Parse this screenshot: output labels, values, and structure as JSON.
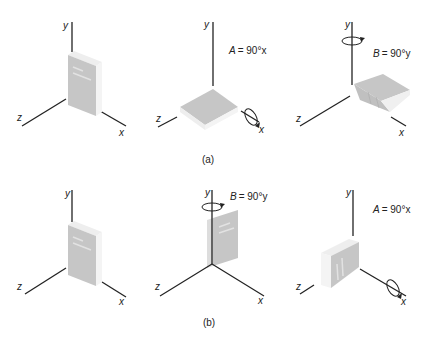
{
  "rows": [
    {
      "caption": "(a)",
      "panels": [
        {
          "state": "initial",
          "axes": {
            "x": "x",
            "y": "y",
            "z": "z"
          }
        },
        {
          "state": "after-rotation-A",
          "equation": {
            "lhs": "A",
            "rhs": "= 90°x"
          },
          "rotation_axis": "x",
          "axes": {
            "x": "x",
            "y": "y",
            "z": "z"
          }
        },
        {
          "state": "after-rotation-B",
          "equation": {
            "lhs": "B",
            "rhs": "= 90°y"
          },
          "rotation_axis": "y",
          "axes": {
            "x": "x",
            "y": "y",
            "z": "z"
          }
        }
      ]
    },
    {
      "caption": "(b)",
      "panels": [
        {
          "state": "initial",
          "axes": {
            "x": "x",
            "y": "y",
            "z": "z"
          }
        },
        {
          "state": "after-rotation-B",
          "equation": {
            "lhs": "B",
            "rhs": "= 90°y"
          },
          "rotation_axis": "y",
          "axes": {
            "x": "x",
            "y": "y",
            "z": "z"
          }
        },
        {
          "state": "after-rotation-A",
          "equation": {
            "lhs": "A",
            "rhs": "= 90°x"
          },
          "rotation_axis": "x",
          "axes": {
            "x": "x",
            "y": "y",
            "z": "z"
          }
        }
      ]
    }
  ],
  "colors": {
    "axis": "#222222",
    "book_face": "#c8c8c8",
    "book_side": "#e6e6e6",
    "book_pages": "#f2f2f2"
  }
}
